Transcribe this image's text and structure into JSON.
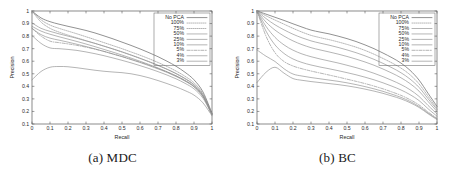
{
  "figure": {
    "panels": [
      {
        "id": "mdc",
        "caption": "(a) MDC",
        "chart_ref": 0
      },
      {
        "id": "bc",
        "caption": "(b) BC",
        "chart_ref": 1
      }
    ]
  },
  "chart_data": [
    {
      "type": "line",
      "title": "",
      "panel_label": "(a) MDC",
      "xlabel": "Recall",
      "ylabel": "Precision",
      "xlim": [
        0,
        1
      ],
      "ylim": [
        0.1,
        1
      ],
      "xticks": [
        "0",
        "0.1",
        "0.2",
        "0.3",
        "0.4",
        "0.5",
        "0.6",
        "0.7",
        "0.8",
        "0.9",
        "1"
      ],
      "yticks": [
        "0.1",
        "0.2",
        "0.3",
        "0.4",
        "0.5",
        "0.6",
        "0.7",
        "0.8",
        "0.9",
        "1"
      ],
      "grid": false,
      "legend_position": "top-right",
      "x": [
        0,
        0.05,
        0.1,
        0.15,
        0.2,
        0.25,
        0.3,
        0.35,
        0.4,
        0.45,
        0.5,
        0.55,
        0.6,
        0.65,
        0.7,
        0.75,
        0.8,
        0.85,
        0.9,
        0.95,
        1
      ],
      "series": [
        {
          "name": "No PCA",
          "style": "solid",
          "values": [
            1.0,
            0.945,
            0.915,
            0.895,
            0.878,
            0.862,
            0.845,
            0.825,
            0.802,
            0.778,
            0.752,
            0.726,
            0.698,
            0.668,
            0.636,
            0.6,
            0.56,
            0.512,
            0.452,
            0.355,
            0.185
          ]
        },
        {
          "name": "100%",
          "style": "dotted",
          "values": [
            1.0,
            0.93,
            0.888,
            0.862,
            0.84,
            0.818,
            0.795,
            0.772,
            0.748,
            0.724,
            0.7,
            0.674,
            0.648,
            0.62,
            0.59,
            0.558,
            0.522,
            0.48,
            0.428,
            0.34,
            0.182
          ]
        },
        {
          "name": "75%",
          "style": "dotted",
          "values": [
            1.0,
            0.912,
            0.862,
            0.832,
            0.808,
            0.786,
            0.764,
            0.742,
            0.72,
            0.697,
            0.673,
            0.648,
            0.622,
            0.595,
            0.566,
            0.535,
            0.5,
            0.46,
            0.41,
            0.328,
            0.18
          ]
        },
        {
          "name": "50%",
          "style": "solid",
          "values": [
            0.905,
            0.862,
            0.838,
            0.818,
            0.8,
            0.782,
            0.762,
            0.742,
            0.72,
            0.698,
            0.675,
            0.65,
            0.624,
            0.597,
            0.568,
            0.537,
            0.503,
            0.463,
            0.414,
            0.332,
            0.18
          ]
        },
        {
          "name": "25%",
          "style": "solid",
          "values": [
            0.878,
            0.84,
            0.815,
            0.795,
            0.776,
            0.757,
            0.737,
            0.716,
            0.694,
            0.672,
            0.649,
            0.625,
            0.6,
            0.574,
            0.546,
            0.516,
            0.483,
            0.445,
            0.398,
            0.32,
            0.178
          ]
        },
        {
          "name": "10%",
          "style": "solid",
          "values": [
            0.862,
            0.812,
            0.784,
            0.768,
            0.752,
            0.735,
            0.717,
            0.698,
            0.678,
            0.657,
            0.636,
            0.613,
            0.59,
            0.565,
            0.539,
            0.511,
            0.479,
            0.442,
            0.396,
            0.318,
            0.176
          ]
        },
        {
          "name": "5%",
          "style": "dashed",
          "values": [
            0.862,
            0.8,
            0.76,
            0.748,
            0.738,
            0.726,
            0.712,
            0.696,
            0.678,
            0.658,
            0.638,
            0.616,
            0.593,
            0.569,
            0.543,
            0.515,
            0.484,
            0.447,
            0.4,
            0.32,
            0.176
          ]
        },
        {
          "name": "4%",
          "style": "solid",
          "values": [
            0.805,
            0.742,
            0.706,
            0.7,
            0.694,
            0.686,
            0.674,
            0.66,
            0.644,
            0.626,
            0.607,
            0.587,
            0.565,
            0.542,
            0.517,
            0.49,
            0.46,
            0.424,
            0.38,
            0.305,
            0.172
          ]
        },
        {
          "name": "3%",
          "style": "solid",
          "values": [
            0.452,
            0.518,
            0.552,
            0.558,
            0.556,
            0.548,
            0.538,
            0.528,
            0.52,
            0.514,
            0.509,
            0.5,
            0.486,
            0.468,
            0.446,
            0.422,
            0.396,
            0.366,
            0.33,
            0.268,
            0.165
          ]
        }
      ]
    },
    {
      "type": "line",
      "title": "",
      "panel_label": "(b) BC",
      "xlabel": "Recall",
      "ylabel": "Precision",
      "xlim": [
        0,
        1
      ],
      "ylim": [
        0.1,
        1
      ],
      "xticks": [
        "0",
        "0.1",
        "0.2",
        "0.3",
        "0.4",
        "0.5",
        "0.6",
        "0.7",
        "0.8",
        "0.9",
        "1"
      ],
      "yticks": [
        "0.1",
        "0.2",
        "0.3",
        "0.4",
        "0.5",
        "0.6",
        "0.7",
        "0.8",
        "0.9",
        "1"
      ],
      "grid": false,
      "legend_position": "top-right",
      "x": [
        0,
        0.05,
        0.1,
        0.15,
        0.2,
        0.25,
        0.3,
        0.35,
        0.4,
        0.45,
        0.5,
        0.55,
        0.6,
        0.65,
        0.7,
        0.75,
        0.8,
        0.85,
        0.9,
        0.95,
        1
      ],
      "series": [
        {
          "name": "No PCA",
          "style": "solid",
          "values": [
            1.0,
            0.975,
            0.95,
            0.925,
            0.898,
            0.872,
            0.848,
            0.832,
            0.818,
            0.8,
            0.78,
            0.757,
            0.73,
            0.7,
            0.665,
            0.628,
            0.585,
            0.528,
            0.45,
            0.345,
            0.24
          ]
        },
        {
          "name": "100%",
          "style": "dotted",
          "values": [
            1.0,
            0.962,
            0.928,
            0.895,
            0.862,
            0.832,
            0.806,
            0.788,
            0.772,
            0.754,
            0.734,
            0.712,
            0.686,
            0.656,
            0.622,
            0.586,
            0.545,
            0.492,
            0.42,
            0.322,
            0.225
          ]
        },
        {
          "name": "75%",
          "style": "solid",
          "values": [
            1.0,
            0.94,
            0.89,
            0.85,
            0.815,
            0.786,
            0.762,
            0.744,
            0.728,
            0.71,
            0.69,
            0.668,
            0.643,
            0.615,
            0.583,
            0.548,
            0.508,
            0.458,
            0.392,
            0.302,
            0.215
          ]
        },
        {
          "name": "50%",
          "style": "solid",
          "values": [
            1.0,
            0.912,
            0.848,
            0.8,
            0.762,
            0.732,
            0.708,
            0.69,
            0.674,
            0.657,
            0.638,
            0.617,
            0.594,
            0.568,
            0.538,
            0.505,
            0.468,
            0.422,
            0.362,
            0.28,
            0.2
          ]
        },
        {
          "name": "25%",
          "style": "solid",
          "values": [
            1.0,
            0.878,
            0.79,
            0.73,
            0.688,
            0.658,
            0.636,
            0.618,
            0.602,
            0.586,
            0.568,
            0.549,
            0.528,
            0.504,
            0.477,
            0.447,
            0.414,
            0.373,
            0.32,
            0.248,
            0.18
          ]
        },
        {
          "name": "10%",
          "style": "solid",
          "values": [
            1.0,
            0.84,
            0.73,
            0.662,
            0.618,
            0.59,
            0.57,
            0.554,
            0.54,
            0.525,
            0.509,
            0.492,
            0.473,
            0.452,
            0.428,
            0.401,
            0.371,
            0.334,
            0.287,
            0.222,
            0.162
          ]
        },
        {
          "name": "5%",
          "style": "dashed",
          "values": [
            1.0,
            0.8,
            0.668,
            0.598,
            0.562,
            0.54,
            0.522,
            0.506,
            0.49,
            0.474,
            0.457,
            0.44,
            0.422,
            0.402,
            0.38,
            0.355,
            0.328,
            0.294,
            0.252,
            0.196,
            0.145
          ]
        },
        {
          "name": "4%",
          "style": "solid",
          "values": [
            0.69,
            0.64,
            0.598,
            0.54,
            0.498,
            0.482,
            0.47,
            0.46,
            0.45,
            0.44,
            0.428,
            0.414,
            0.398,
            0.38,
            0.36,
            0.337,
            0.312,
            0.28,
            0.24,
            0.188,
            0.14
          ]
        },
        {
          "name": "3%",
          "style": "solid",
          "values": [
            0.43,
            0.512,
            0.552,
            0.505,
            0.462,
            0.448,
            0.438,
            0.43,
            0.422,
            0.414,
            0.404,
            0.392,
            0.378,
            0.362,
            0.344,
            0.323,
            0.3,
            0.27,
            0.232,
            0.182,
            0.135
          ]
        }
      ]
    }
  ]
}
